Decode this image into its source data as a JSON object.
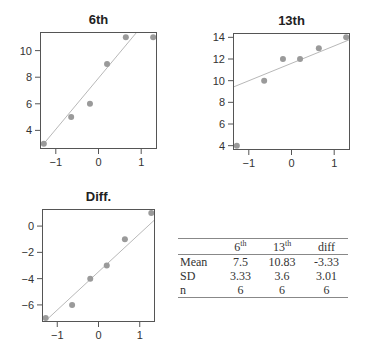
{
  "chart_data": [
    {
      "type": "scatter",
      "title": "6th",
      "subtype": "normal-qq",
      "xlabel": "",
      "ylabel": "",
      "xlim": [
        -1.37,
        1.37
      ],
      "ylim": [
        2.6,
        11.4
      ],
      "xticks": [
        -1,
        0,
        1
      ],
      "xtick_labels": [
        "−1",
        "0",
        "1"
      ],
      "yticks": [
        4,
        6,
        8,
        10
      ],
      "ytick_labels": [
        "4",
        "6",
        "8",
        "10"
      ],
      "points": [
        {
          "x": -1.28,
          "y": 3
        },
        {
          "x": -0.64,
          "y": 5
        },
        {
          "x": -0.2,
          "y": 6
        },
        {
          "x": 0.2,
          "y": 9
        },
        {
          "x": 0.64,
          "y": 11
        },
        {
          "x": 1.28,
          "y": 11
        }
      ],
      "reference_line": {
        "x0": -1.28,
        "y0": 3.0,
        "x1": 0.9,
        "y1": 11.4
      },
      "grid": false
    },
    {
      "type": "scatter",
      "title": "13th",
      "subtype": "normal-qq",
      "xlabel": "",
      "ylabel": "",
      "xlim": [
        -1.37,
        1.37
      ],
      "ylim": [
        3.6,
        14.4
      ],
      "xticks": [
        -1,
        0,
        1
      ],
      "xtick_labels": [
        "−1",
        "0",
        "1"
      ],
      "yticks": [
        4,
        6,
        8,
        10,
        12,
        14
      ],
      "ytick_labels": [
        "4",
        "6",
        "8",
        "10",
        "12",
        "14"
      ],
      "points": [
        {
          "x": -1.28,
          "y": 4
        },
        {
          "x": -0.64,
          "y": 10
        },
        {
          "x": -0.2,
          "y": 12
        },
        {
          "x": 0.2,
          "y": 12
        },
        {
          "x": 0.64,
          "y": 13
        },
        {
          "x": 1.28,
          "y": 14
        }
      ],
      "reference_line": {
        "x0": -1.37,
        "y0": 9.4,
        "x1": 1.37,
        "y1": 13.8
      },
      "grid": false
    },
    {
      "type": "scatter",
      "title": "Diff.",
      "subtype": "normal-qq",
      "xlabel": "",
      "ylabel": "",
      "xlim": [
        -1.37,
        1.37
      ],
      "ylim": [
        -7.3,
        1.3
      ],
      "xticks": [
        -1,
        0,
        1
      ],
      "xtick_labels": [
        "−1",
        "0",
        "1"
      ],
      "yticks": [
        -6,
        -4,
        -2,
        0
      ],
      "ytick_labels": [
        "−6",
        "−4",
        "−2",
        "0"
      ],
      "points": [
        {
          "x": -1.28,
          "y": -7
        },
        {
          "x": -0.64,
          "y": -6
        },
        {
          "x": -0.2,
          "y": -4
        },
        {
          "x": 0.2,
          "y": -3
        },
        {
          "x": 0.64,
          "y": -1
        },
        {
          "x": 1.28,
          "y": 1
        }
      ],
      "reference_line": {
        "x0": -1.28,
        "y0": -7.2,
        "x1": 1.37,
        "y1": 0.5
      },
      "grid": false
    },
    {
      "type": "table",
      "columns": [
        "",
        "6th",
        "13th",
        "diff"
      ],
      "rows": [
        [
          "Mean",
          "7.5",
          "10.83",
          "-3.33"
        ],
        [
          "SD",
          "3.33",
          "3.6",
          "3.01"
        ],
        [
          "n",
          "6",
          "6",
          "6"
        ]
      ]
    }
  ],
  "colors": {
    "point": "#9a9a9a",
    "line": "#b8b8b8",
    "axis": "#555555",
    "text": "#333333"
  },
  "table": {
    "headers": [
      {
        "base": "6",
        "sup": "th"
      },
      {
        "base": "13",
        "sup": "th"
      },
      {
        "base": "diff",
        "sup": ""
      }
    ],
    "rows": [
      {
        "label": "Mean",
        "values": [
          "7.5",
          "10.83",
          "-3.33"
        ]
      },
      {
        "label": "SD",
        "values": [
          "3.33",
          "3.6",
          "3.01"
        ]
      },
      {
        "label": "n",
        "values": [
          "6",
          "6",
          "6"
        ]
      }
    ]
  }
}
